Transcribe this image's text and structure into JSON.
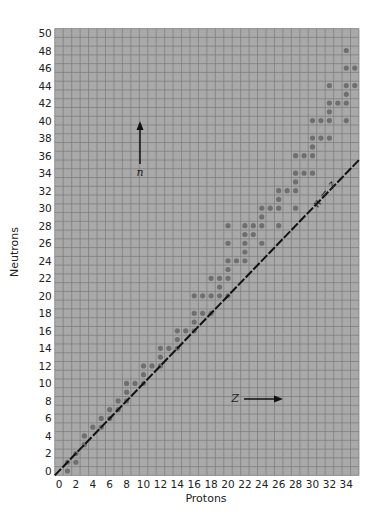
{
  "chart_data": {
    "type": "scatter",
    "title": "",
    "xlabel": "Protons",
    "ylabel": "Neutrons",
    "xlim": [
      0,
      35
    ],
    "ylim": [
      0,
      50
    ],
    "x_ticks": [
      0,
      2,
      4,
      6,
      8,
      10,
      12,
      14,
      16,
      18,
      20,
      22,
      24,
      26,
      28,
      30,
      32,
      34
    ],
    "y_ticks": [
      0,
      2,
      4,
      6,
      8,
      10,
      12,
      14,
      16,
      18,
      20,
      22,
      24,
      26,
      28,
      30,
      32,
      34,
      36,
      38,
      40,
      42,
      44,
      46,
      48,
      50
    ],
    "grid": true,
    "legend": null,
    "reference_line": {
      "label_n": "n",
      "label_eq": "=",
      "label_z": "z",
      "equation": "n = z",
      "style": "dashed"
    },
    "annotations": [
      {
        "text": "n",
        "arrow": "up",
        "meaning": "neutron axis direction"
      },
      {
        "text": "Z",
        "arrow": "right",
        "meaning": "proton axis direction"
      }
    ],
    "stable_nuclides": [
      {
        "z": 1,
        "n": [
          0,
          1
        ]
      },
      {
        "z": 2,
        "n": [
          1,
          2
        ]
      },
      {
        "z": 3,
        "n": [
          3,
          4
        ]
      },
      {
        "z": 4,
        "n": [
          5
        ]
      },
      {
        "z": 5,
        "n": [
          5,
          6
        ]
      },
      {
        "z": 6,
        "n": [
          6,
          7
        ]
      },
      {
        "z": 7,
        "n": [
          7,
          8
        ]
      },
      {
        "z": 8,
        "n": [
          8,
          9,
          10
        ]
      },
      {
        "z": 9,
        "n": [
          10
        ]
      },
      {
        "z": 10,
        "n": [
          10,
          11,
          12
        ]
      },
      {
        "z": 11,
        "n": [
          12
        ]
      },
      {
        "z": 12,
        "n": [
          12,
          13,
          14
        ]
      },
      {
        "z": 13,
        "n": [
          14
        ]
      },
      {
        "z": 14,
        "n": [
          14,
          15,
          16
        ]
      },
      {
        "z": 15,
        "n": [
          16
        ]
      },
      {
        "z": 16,
        "n": [
          16,
          17,
          18,
          20
        ]
      },
      {
        "z": 17,
        "n": [
          18,
          20
        ]
      },
      {
        "z": 18,
        "n": [
          18,
          20,
          22
        ]
      },
      {
        "z": 19,
        "n": [
          20,
          21,
          22
        ]
      },
      {
        "z": 20,
        "n": [
          20,
          22,
          23,
          24,
          26,
          28
        ]
      },
      {
        "z": 21,
        "n": [
          24
        ]
      },
      {
        "z": 22,
        "n": [
          24,
          25,
          26,
          27,
          28
        ]
      },
      {
        "z": 23,
        "n": [
          27,
          28
        ]
      },
      {
        "z": 24,
        "n": [
          26,
          28,
          29,
          30
        ]
      },
      {
        "z": 25,
        "n": [
          30
        ]
      },
      {
        "z": 26,
        "n": [
          28,
          30,
          31,
          32
        ]
      },
      {
        "z": 27,
        "n": [
          32
        ]
      },
      {
        "z": 28,
        "n": [
          30,
          32,
          33,
          34,
          36
        ]
      },
      {
        "z": 29,
        "n": [
          34,
          36
        ]
      },
      {
        "z": 30,
        "n": [
          34,
          36,
          37,
          38,
          40
        ]
      },
      {
        "z": 31,
        "n": [
          38,
          40
        ]
      },
      {
        "z": 32,
        "n": [
          38,
          40,
          41,
          42,
          44
        ]
      },
      {
        "z": 33,
        "n": [
          42
        ]
      },
      {
        "z": 34,
        "n": [
          40,
          42,
          43,
          44,
          46,
          48
        ]
      },
      {
        "z": 35,
        "n": [
          44,
          46
        ]
      }
    ]
  },
  "colors": {
    "grid_background": "#a9a9a9",
    "grid_line": "#7f7f7f",
    "dot": "#6f6f6f",
    "line": "#111111"
  }
}
